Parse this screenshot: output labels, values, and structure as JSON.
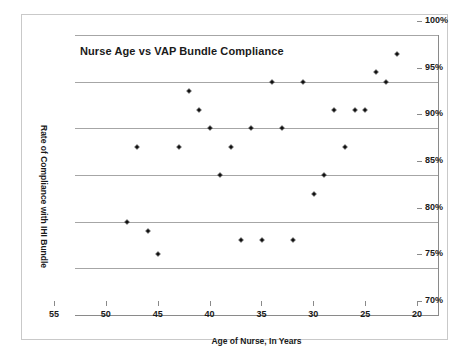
{
  "chart_data": {
    "type": "scatter",
    "title": "Nurse Age vs VAP Bundle Compliance",
    "xlabel": "Age of Nurse, In Years",
    "ylabel": "Rate of Compliance with IHI Bundle",
    "xlim": [
      55,
      20
    ],
    "ylim": [
      70,
      100
    ],
    "x_reversed": true,
    "x_ticks": [
      55,
      50,
      45,
      40,
      35,
      30,
      25,
      20
    ],
    "x_tick_labels": [
      "55",
      "50",
      "45",
      "40",
      "35",
      "30",
      "25",
      "20"
    ],
    "y_ticks": [
      70,
      75,
      80,
      85,
      90,
      95,
      100
    ],
    "y_tick_labels": [
      "70%",
      "75%",
      "80%",
      "85%",
      "90%",
      "95%",
      "100%"
    ],
    "y_axis_position": "right",
    "grid": true,
    "grid_axis": "y",
    "legend": null,
    "marker": "diamond",
    "marker_color": "#111111",
    "points": [
      {
        "x": 50,
        "y": 80.0
      },
      {
        "x": 49,
        "y": 88.0
      },
      {
        "x": 48,
        "y": 79.0
      },
      {
        "x": 47,
        "y": 76.5
      },
      {
        "x": 45,
        "y": 88.0
      },
      {
        "x": 44,
        "y": 94.0
      },
      {
        "x": 43,
        "y": 92.0
      },
      {
        "x": 42,
        "y": 90.0
      },
      {
        "x": 41,
        "y": 85.0
      },
      {
        "x": 40,
        "y": 88.0
      },
      {
        "x": 39,
        "y": 78.0
      },
      {
        "x": 38,
        "y": 90.0
      },
      {
        "x": 37,
        "y": 78.0
      },
      {
        "x": 36,
        "y": 95.0
      },
      {
        "x": 35,
        "y": 90.0
      },
      {
        "x": 34,
        "y": 78.0
      },
      {
        "x": 33,
        "y": 95.0
      },
      {
        "x": 32,
        "y": 83.0
      },
      {
        "x": 31,
        "y": 85.0
      },
      {
        "x": 30,
        "y": 92.0
      },
      {
        "x": 29,
        "y": 88.0
      },
      {
        "x": 28,
        "y": 92.0
      },
      {
        "x": 27,
        "y": 92.0
      },
      {
        "x": 26,
        "y": 96.0
      },
      {
        "x": 25,
        "y": 95.0
      },
      {
        "x": 24,
        "y": 98.0
      }
    ]
  },
  "colors": {
    "grid": "#a6a6a6",
    "axis": "#8a8a8a",
    "frame": "#c9c9c9",
    "marker": "#111111",
    "text": "#1a1a1a",
    "background": "#ffffff"
  }
}
